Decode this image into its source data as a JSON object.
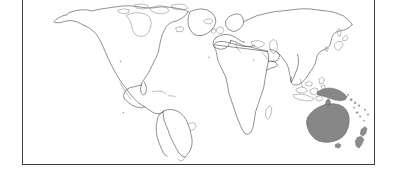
{
  "figure": {
    "kind": "world-map",
    "projection": "robinson",
    "title": "",
    "border_color": "#3b3b42",
    "background": "#ffffff",
    "land_stroke_color": "#4a4a52",
    "highlight_fill": "#878787",
    "highlight_label": "Australia and Oceania",
    "highlighted_regions": [
      "Australia",
      "New Guinea",
      "New Zealand",
      "Tasmania",
      "Solomon Islands",
      "New Caledonia",
      "Fiji"
    ],
    "unhighlighted_regions": [
      "North America",
      "South America",
      "Greenland",
      "Europe",
      "Africa",
      "Asia",
      "Indonesia",
      "Japan",
      "Madagascar",
      "Iceland",
      "United Kingdom"
    ]
  },
  "decor": {
    "left_bar_color": "#848484",
    "right_bar_color": "#848484",
    "left_bar_label": "left-rule",
    "right_bar_label": "right-rule"
  }
}
